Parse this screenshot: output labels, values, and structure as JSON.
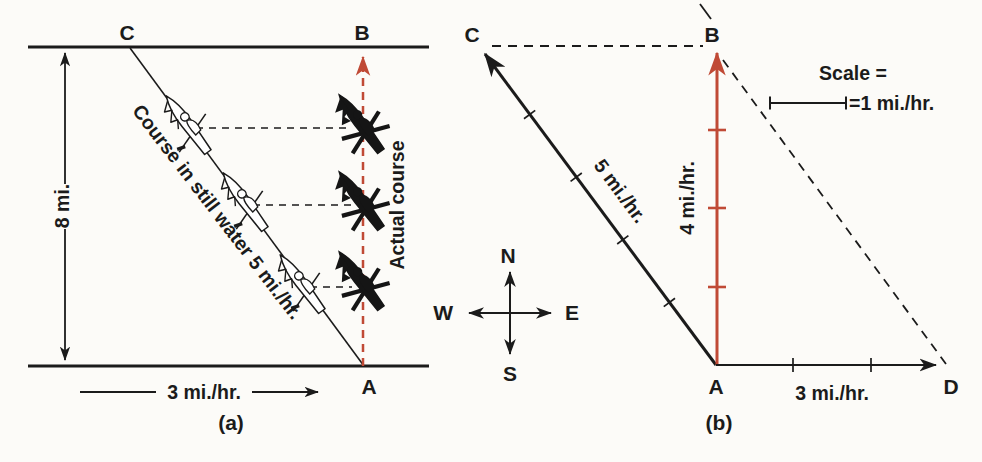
{
  "colors": {
    "paper": "#fcfbf8",
    "ink": "#1b1b1b",
    "red": "#c04a36"
  },
  "panel_a": {
    "caption": "(a)",
    "point_c": "C",
    "point_b": "B",
    "point_a": "A",
    "river_width_label": "8 mi.",
    "current_label": "3 mi./hr.",
    "still_water_course_label": "Course in still water 5 mi./hr.",
    "actual_course_label": "Actual course"
  },
  "panel_b": {
    "caption": "(b)",
    "point_c": "C",
    "point_b": "B",
    "point_a": "A",
    "point_d": "D",
    "boat_velocity_label": "5 mi./hr.",
    "resultant_velocity_label": "4 mi./hr.",
    "current_velocity_label": "3 mi./hr.",
    "scale_title": "Scale =",
    "scale_value": "=1 mi./hr.",
    "compass": {
      "north": "N",
      "south": "S",
      "east": "E",
      "west": "W"
    }
  }
}
